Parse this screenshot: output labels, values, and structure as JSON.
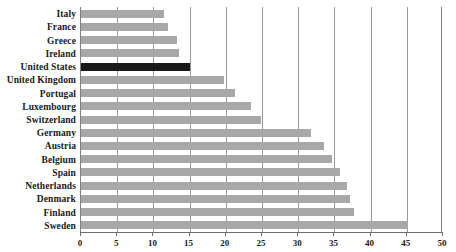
{
  "chart_data": {
    "type": "bar",
    "orientation": "horizontal",
    "title": "",
    "subtitle": "",
    "xlabel": "",
    "ylabel": "",
    "xlim": [
      0,
      50
    ],
    "ylim": null,
    "grid": "vertical",
    "legend": "none",
    "xticks": [
      0,
      5,
      10,
      15,
      20,
      25,
      30,
      35,
      40,
      45,
      50
    ],
    "xtick_labels": [
      "0",
      "5",
      "10",
      "15",
      "20",
      "25",
      "30",
      "35",
      "40",
      "45",
      "50"
    ],
    "categories": [
      "Italy",
      "France",
      "Greece",
      "Ireland",
      "United States",
      "United Kingdom",
      "Portugal",
      "Luxembourg",
      "Switzerland",
      "Germany",
      "Austria",
      "Belgium",
      "Spain",
      "Netherlands",
      "Denmark",
      "Finland",
      "Sweden"
    ],
    "values": [
      11.5,
      12.0,
      13.2,
      13.5,
      15.0,
      19.8,
      21.3,
      23.5,
      24.8,
      31.7,
      33.6,
      34.6,
      35.8,
      36.8,
      37.1,
      37.7,
      45.2
    ],
    "highlight_category": "United States",
    "colors": {
      "bar": "#a8a8a8",
      "highlight_bar": "#191919",
      "gridline": "#9a9a9a",
      "axis": "#6e6e6e",
      "text": "#1a1a1a",
      "background": "#ffffff"
    }
  }
}
